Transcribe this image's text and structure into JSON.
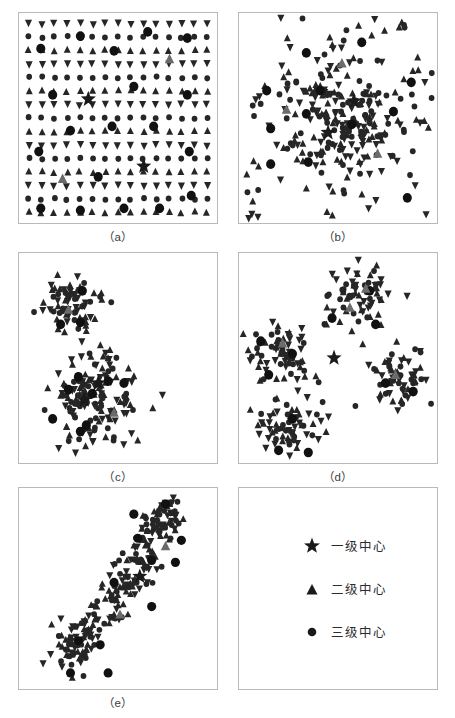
{
  "figure": {
    "width": 455,
    "height": 718,
    "background": "#ffffff",
    "panel_border_color": "#b9b9b9"
  },
  "colors": {
    "level1_star": "#1a1a1a",
    "level2_triangle": "#6b6b6b",
    "level3_circle": "#111111",
    "level4_point": "#262626",
    "label_text": "#3a3a3a",
    "legend_text": "#2b2b2b"
  },
  "legend": {
    "name": "centrality-hierarchy-legend",
    "items": [
      {
        "marker": "star-icon",
        "label": "一级中心"
      },
      {
        "marker": "triangle-icon",
        "label": "二级中心"
      },
      {
        "marker": "circle-icon",
        "label": "三级中心"
      }
    ]
  },
  "panels": [
    {
      "id": "a",
      "label": "（a）",
      "pattern": "uniform-grid",
      "has_label": true
    },
    {
      "id": "b",
      "label": "（b）",
      "pattern": "single-center",
      "has_label": true
    },
    {
      "id": "c",
      "label": "（c）",
      "pattern": "two-clusters",
      "has_label": true
    },
    {
      "id": "d",
      "label": "（d）",
      "pattern": "four-clusters-ring",
      "has_label": true
    },
    {
      "id": "e",
      "label": "（e）",
      "pattern": "diagonal-corridor",
      "has_label": true
    },
    {
      "id": "legend",
      "label": "",
      "pattern": "legend",
      "has_label": false
    }
  ],
  "chart_data": {
    "type": "scatter",
    "title": "",
    "xlabel": "",
    "ylabel": "",
    "xlim": [
      0,
      100
    ],
    "ylim": [
      0,
      100
    ],
    "grid": false,
    "legend_position": "sixth-panel",
    "marker_classes": [
      {
        "key": "level1",
        "name": "一级中心",
        "shape": "star",
        "size": 13
      },
      {
        "key": "level2",
        "name": "二级中心",
        "shape": "triangle",
        "size": 9
      },
      {
        "key": "level3",
        "name": "三级中心",
        "shape": "circle",
        "size": 8
      },
      {
        "key": "level4",
        "name": "",
        "shape": "point",
        "size": 3
      }
    ],
    "panels": [
      {
        "id": "a",
        "caption": "（a）",
        "description": "uniform lattice distribution",
        "generator": {
          "kind": "grid",
          "cols": 15,
          "rows": 15,
          "margin": 5,
          "jitter": 0.9
        },
        "level1": [
          [
            35,
            41
          ],
          [
            63,
            73
          ]
        ],
        "level2": [
          [
            76,
            22
          ],
          [
            22,
            79
          ]
        ],
        "level3": [
          [
            31,
            11
          ],
          [
            65,
            9
          ],
          [
            85,
            12
          ],
          [
            11,
            17
          ],
          [
            48,
            18
          ],
          [
            17,
            39
          ],
          [
            58,
            35
          ],
          [
            85,
            39
          ],
          [
            26,
            56
          ],
          [
            47,
            54
          ],
          [
            68,
            54
          ],
          [
            10,
            66
          ],
          [
            86,
            66
          ],
          [
            40,
            78
          ],
          [
            11,
            93
          ],
          [
            31,
            94
          ],
          [
            53,
            93
          ],
          [
            71,
            93
          ],
          [
            87,
            87
          ]
        ]
      },
      {
        "id": "b",
        "caption": "（b）",
        "description": "single dominant center with radial density decay",
        "generator": {
          "kind": "radial",
          "cx": 50,
          "cy": 52,
          "n": 260,
          "sigma": 15,
          "tail": 0.35
        },
        "level1": [
          [
            58,
            42
          ],
          [
            45,
            57
          ]
        ],
        "level2": [
          [
            52,
            24
          ],
          [
            24,
            46
          ],
          [
            70,
            67
          ]
        ],
        "level3": [
          [
            62,
            14
          ],
          [
            34,
            19
          ],
          [
            14,
            37
          ],
          [
            41,
            37
          ],
          [
            87,
            33
          ],
          [
            16,
            55
          ],
          [
            34,
            48
          ],
          [
            78,
            47
          ],
          [
            57,
            53
          ],
          [
            16,
            72
          ],
          [
            35,
            71
          ],
          [
            85,
            88
          ]
        ]
      },
      {
        "id": "c",
        "caption": "（c）",
        "description": "two separated clusters, small upper-left and large lower-left",
        "generator": {
          "kind": "clusters",
          "clusters": [
            {
              "cx": 28,
              "cy": 24,
              "n": 70,
              "r": 14
            },
            {
              "cx": 38,
              "cy": 70,
              "n": 150,
              "r": 20
            }
          ]
        },
        "level1": [
          [
            40,
            62
          ],
          [
            33,
            70
          ]
        ],
        "level2": [
          [
            25,
            27
          ],
          [
            48,
            76
          ]
        ],
        "level3": [
          [
            32,
            18
          ],
          [
            21,
            34
          ],
          [
            31,
            33
          ],
          [
            30,
            59
          ],
          [
            45,
            61
          ],
          [
            53,
            62
          ],
          [
            25,
            65
          ],
          [
            37,
            67
          ],
          [
            17,
            79
          ],
          [
            34,
            82
          ],
          [
            31,
            85
          ]
        ]
      },
      {
        "id": "d",
        "caption": "（d）",
        "description": "four peripheral clusters around an isolated central node",
        "generator": {
          "kind": "clusters",
          "clusters": [
            {
              "cx": 58,
              "cy": 22,
              "n": 65,
              "r": 14
            },
            {
              "cx": 20,
              "cy": 46,
              "n": 65,
              "r": 14
            },
            {
              "cx": 80,
              "cy": 58,
              "n": 65,
              "r": 14
            },
            {
              "cx": 25,
              "cy": 82,
              "n": 65,
              "r": 14
            }
          ]
        },
        "level1": [
          [
            48,
            50
          ]
        ],
        "level2": [
          [
            64,
            17
          ],
          [
            56,
            26
          ],
          [
            22,
            43
          ],
          [
            79,
            58
          ]
        ],
        "level3": [
          [
            66,
            18
          ],
          [
            47,
            31
          ],
          [
            69,
            34
          ],
          [
            11,
            42
          ],
          [
            27,
            48
          ],
          [
            15,
            58
          ],
          [
            74,
            62
          ],
          [
            88,
            66
          ],
          [
            27,
            79
          ],
          [
            20,
            94
          ],
          [
            35,
            95
          ]
        ]
      },
      {
        "id": "e",
        "caption": "（e）",
        "description": "diagonal development corridor from lower-left to upper-right",
        "generator": {
          "kind": "corridor",
          "path": [
            [
              22,
              86
            ],
            [
              33,
              72
            ],
            [
              46,
              58
            ],
            [
              58,
              42
            ],
            [
              70,
              22
            ],
            [
              76,
              10
            ]
          ],
          "n": 230,
          "width": 9
        },
        "level1": [
          [
            61,
            44
          ]
        ],
        "level2": [
          [
            74,
            29
          ],
          [
            51,
            63
          ]
        ],
        "level3": [
          [
            74,
            8
          ],
          [
            58,
            13
          ],
          [
            60,
            25
          ],
          [
            82,
            26
          ],
          [
            67,
            36
          ],
          [
            79,
            37
          ],
          [
            48,
            47
          ],
          [
            67,
            59
          ],
          [
            30,
            76
          ],
          [
            41,
            78
          ],
          [
            26,
            92
          ],
          [
            45,
            92
          ]
        ]
      }
    ]
  }
}
